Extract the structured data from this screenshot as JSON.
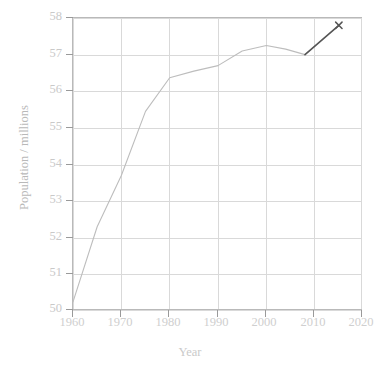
{
  "chart_data": {
    "type": "line",
    "title": "",
    "xlabel": "Year",
    "ylabel": "Population / millions",
    "xlim": [
      1960,
      2020
    ],
    "ylim": [
      50,
      58
    ],
    "xticks": [
      1960,
      1970,
      1980,
      1990,
      2000,
      2010,
      2020
    ],
    "yticks": [
      50,
      51,
      52,
      53,
      54,
      55,
      56,
      57,
      58
    ],
    "grid": true,
    "legend": "none",
    "series": [
      {
        "name": "Population",
        "color": "#bdbdbd",
        "marker": "none",
        "x": [
          1960,
          1965,
          1970,
          1975,
          1980,
          1985,
          1990,
          1995,
          2000,
          2004,
          2008
        ],
        "values": [
          50.25,
          52.3,
          53.7,
          55.45,
          56.37,
          56.55,
          56.7,
          57.1,
          57.25,
          57.15,
          57.0
        ]
      },
      {
        "name": "Extrapolation",
        "color": "#555555",
        "marker": "x",
        "x": [
          2008,
          2015
        ],
        "values": [
          57.0,
          57.8
        ]
      }
    ],
    "annotations": [
      {
        "label": "x-marker",
        "x": 2015,
        "y": 57.8
      }
    ]
  },
  "axis": {
    "x_tick_labels": [
      "1960",
      "1970",
      "1980",
      "1990",
      "2000",
      "2010",
      "2020"
    ],
    "y_tick_labels": [
      "50",
      "51",
      "52",
      "53",
      "54",
      "55",
      "56",
      "57",
      "58"
    ],
    "x_title": "Year",
    "y_title": "Population / millions"
  },
  "title_clipped": "",
  "colors": {
    "series_line": "#bdbdbd",
    "extrapolation_line": "#555555",
    "gridline": "#d9d9d9",
    "axis": "#b9b9b9",
    "tick_text": "#cbcbcb"
  }
}
